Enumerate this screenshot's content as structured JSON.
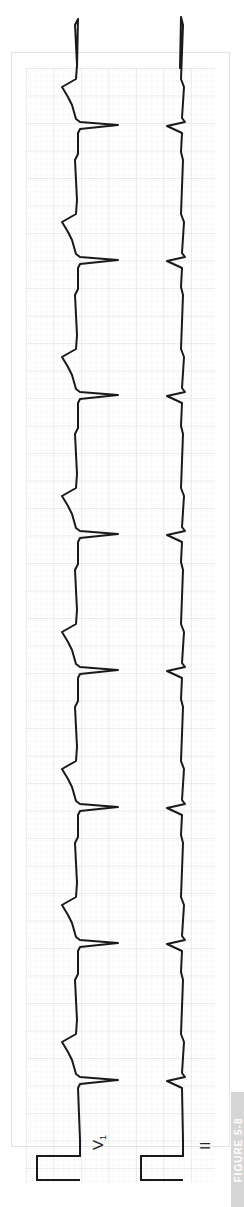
{
  "figure": {
    "label": "FIGURE 5-8",
    "orientation": "rotated 90deg (time runs bottom to top)"
  },
  "ecg": {
    "paper": {
      "background": "#ffffff",
      "minor_grid": "#ececec",
      "major_grid": "#d2d2d2",
      "trace": "#1a1a1a"
    },
    "leads": [
      {
        "name": "V1",
        "label_text": "V₁",
        "calibration_pulse": true,
        "qrs_direction": "negative (deep S)",
        "beats": 8
      },
      {
        "name": "II",
        "label_text": "II",
        "calibration_pulse": true,
        "qrs_direction": "small, narrow",
        "beats": 8
      }
    ],
    "beat_positions_px": [
      125,
      260,
      395,
      534,
      670,
      807,
      943,
      1080
    ],
    "rhythm": "regular"
  }
}
